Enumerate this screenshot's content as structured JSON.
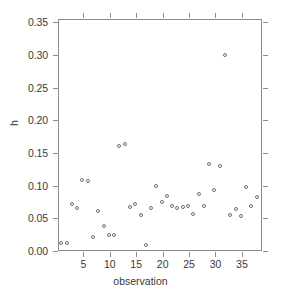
{
  "chart_data": {
    "type": "scatter",
    "title": "",
    "xlabel": "observation",
    "ylabel": "h",
    "xlim": [
      0.2,
      38.8
    ],
    "ylim": [
      0.0,
      0.355
    ],
    "grid": false,
    "legend": null,
    "x_ticks": [
      5,
      10,
      15,
      20,
      25,
      30,
      35
    ],
    "x_tick_labels": [
      "5",
      "10",
      "15",
      "20",
      "25",
      "30",
      "35"
    ],
    "y_ticks": [
      0.0,
      0.05,
      0.1,
      0.15,
      0.2,
      0.25,
      0.3,
      0.35
    ],
    "y_tick_labels": [
      "0.00",
      "0.05",
      "0.10",
      "0.15",
      "0.20",
      "0.25",
      "0.30",
      "0.35"
    ],
    "marker": "open-circle",
    "marker_color": "#6e6e76",
    "x": [
      1,
      2,
      3,
      4,
      5,
      6,
      7,
      8,
      9,
      10,
      11,
      12,
      13,
      14,
      15,
      16,
      17,
      18,
      19,
      20,
      21,
      22,
      23,
      24,
      25,
      26,
      27,
      28,
      29,
      30,
      31,
      32,
      33,
      34,
      35,
      36,
      37,
      38
    ],
    "y": [
      0.011,
      0.011,
      0.071,
      0.065,
      0.107,
      0.106,
      0.02,
      0.059,
      0.037,
      0.023,
      0.023,
      0.159,
      0.162,
      0.066,
      0.071,
      0.053,
      0.008,
      0.065,
      0.098,
      0.073,
      0.082,
      0.067,
      0.065,
      0.066,
      0.068,
      0.055,
      0.086,
      0.067,
      0.132,
      0.092,
      0.129,
      0.298,
      0.054,
      0.062,
      0.052,
      0.097,
      0.067,
      0.081
    ],
    "series_name": "h"
  },
  "axes": {
    "x_title": "observation",
    "y_title": "h"
  }
}
